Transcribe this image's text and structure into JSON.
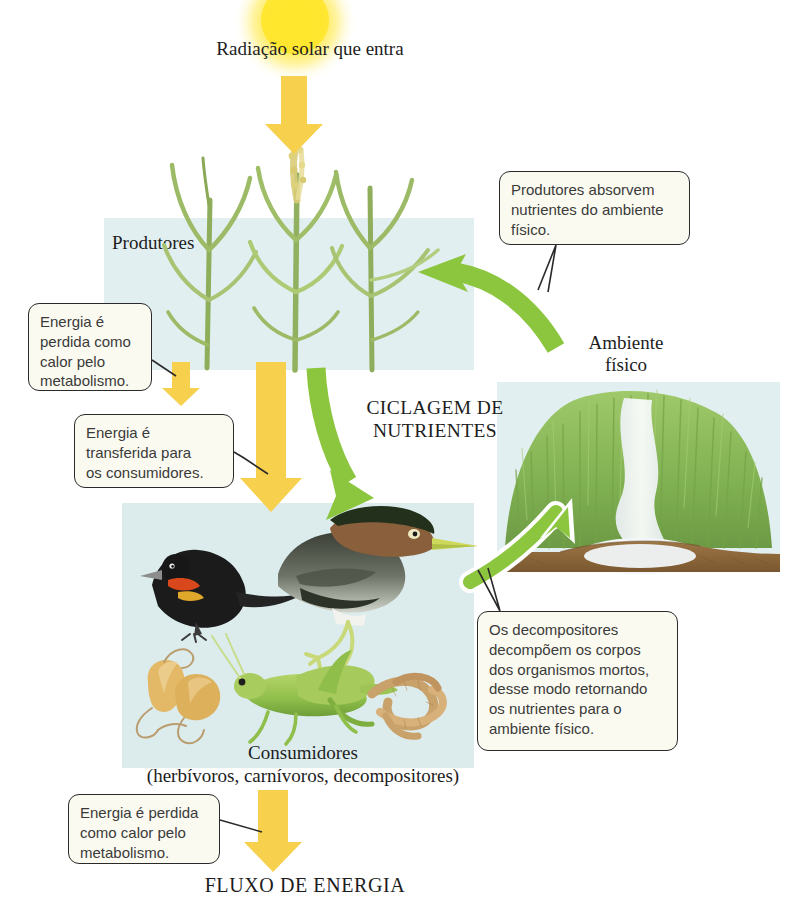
{
  "diagram": {
    "title_top": "Radiação solar que entra",
    "title_bottom": "FLUXO DE ENERGIA",
    "center_label": "CICLAGEM DE\nNUTRIENTES",
    "center_label_line1": "CICLAGEM DE",
    "center_label_line2": "NUTRIENTES"
  },
  "panels": {
    "producers": {
      "label": "Produtores",
      "bg": "#e2eff1"
    },
    "consumers": {
      "label_line1": "Consumidores",
      "label_line2": "(herbívoros, carnívoros, decompositores)",
      "bg": "#dceced"
    },
    "environment": {
      "label_line1": "Ambiente",
      "label_line2": "físico",
      "bg": "#e2eff1"
    }
  },
  "callouts": [
    {
      "name": "heat-loss-producers",
      "lines": [
        "Energia é",
        "perdida como",
        "calor pelo",
        "metabolismo."
      ]
    },
    {
      "name": "energy-transfer",
      "lines": [
        "Energia é",
        "transferida para",
        "os consumidores."
      ]
    },
    {
      "name": "producers-absorb-nutrients",
      "lines": [
        "Produtores absorvem",
        "nutrientes do ambiente",
        "físico."
      ]
    },
    {
      "name": "decomposers",
      "lines": [
        "Os decompositores",
        "decompõem os corpos",
        "dos organismos mortos,",
        "desse modo retornando",
        "os nutrientes para o",
        "ambiente físico."
      ]
    },
    {
      "name": "heat-loss-consumers",
      "lines": [
        "Energia é perdida",
        "como calor pelo",
        "metabolismo."
      ]
    }
  ],
  "arrows": {
    "energy_color": "#f7d04e",
    "nutrient_color": "#8cc63f",
    "items": [
      {
        "name": "solar-energy-arrow",
        "kind": "energy",
        "from": "sun",
        "to": "producers"
      },
      {
        "name": "producer-heat-loss-arrow",
        "kind": "energy",
        "from": "producers",
        "to": "heat"
      },
      {
        "name": "energy-to-consumers-arrow",
        "kind": "energy",
        "from": "producers",
        "to": "consumers"
      },
      {
        "name": "consumer-heat-loss-arrow",
        "kind": "energy",
        "from": "consumers",
        "to": "heat"
      },
      {
        "name": "producers-to-consumers-nutrient-arrow",
        "kind": "nutrient",
        "from": "producers",
        "to": "consumers"
      },
      {
        "name": "consumers-to-environment-nutrient-arrow",
        "kind": "nutrient",
        "from": "consumers",
        "to": "environment"
      },
      {
        "name": "environment-to-producers-nutrient-arrow",
        "kind": "nutrient",
        "from": "environment",
        "to": "producers"
      }
    ]
  },
  "organisms": {
    "producers": [
      "grass-stalk",
      "grass-stalk",
      "grain-spike"
    ],
    "consumers": [
      "blackbird",
      "heron",
      "grasshopper",
      "mushrooms",
      "earthworms"
    ],
    "environment": [
      "grass-bank",
      "stream",
      "soil-layer"
    ]
  },
  "colors": {
    "sun": "#fff176",
    "sun_core": "#ffe94d",
    "panel_blue": "#e2eff1",
    "panel_teal": "#dceced",
    "callout_bg": "#fbfaf1",
    "callout_border": "#2a2a2a",
    "soil": "#8d6a3f",
    "text": "#1d1d1d"
  }
}
